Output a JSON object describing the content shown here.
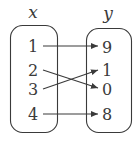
{
  "diagram": {
    "type": "mapping-diagram",
    "domain_label": "x",
    "range_label": "y",
    "domain": [
      "1",
      "2",
      "3",
      "4"
    ],
    "range": [
      "9",
      "1",
      "0",
      "8"
    ],
    "mappings": [
      {
        "from": "1",
        "to": "9"
      },
      {
        "from": "2",
        "to": "0"
      },
      {
        "from": "3",
        "to": "1"
      },
      {
        "from": "4",
        "to": "8"
      }
    ],
    "colors": {
      "stroke": "#3a3a3a",
      "background": "#ffffff"
    }
  }
}
